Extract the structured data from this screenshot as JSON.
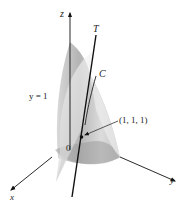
{
  "figure": {
    "axes": {
      "x_label": "x",
      "y_label": "y",
      "z_label": "z",
      "origin_label": "0"
    },
    "labels": {
      "tangent_line": "T",
      "curve": "C",
      "plane": "y = 1",
      "point": "(1, 1, 1)"
    },
    "colors": {
      "surface_light": "#e6e6e6",
      "surface_mid": "#c9c9c9",
      "surface_dark": "#9a9a9a",
      "line": "#111111"
    }
  }
}
